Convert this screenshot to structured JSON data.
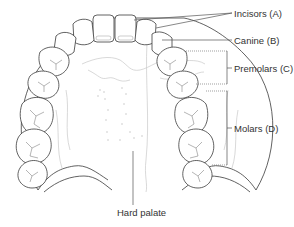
{
  "figure": {
    "labels": {
      "incisors": "Incisors (A)",
      "canine": "Canine (B)",
      "premolars": "Premolars (C)",
      "molars": "Molars (D)",
      "hard_palate": "Hard palate"
    },
    "colors": {
      "line": "#3a3a3a",
      "soft_detail": "#c8c8c8",
      "label_text": "#333333",
      "background": "#ffffff"
    }
  }
}
